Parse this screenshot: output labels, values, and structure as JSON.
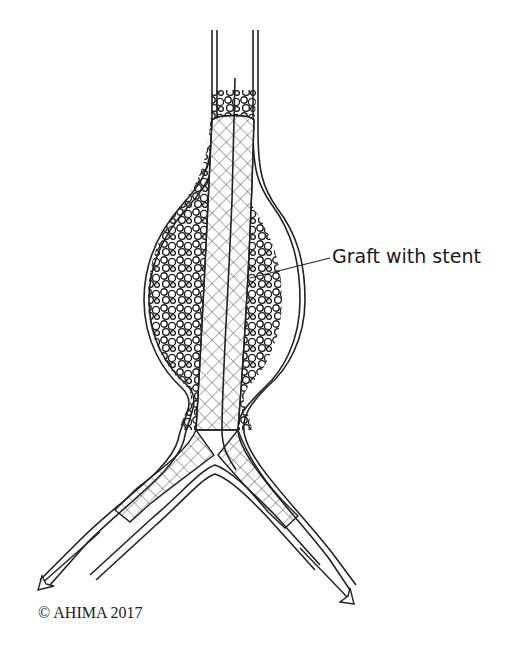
{
  "figure": {
    "label": "Graft with stent",
    "copyright": "© AHIMA 2017"
  },
  "colors": {
    "line": "#222222",
    "background": "#ffffff"
  }
}
